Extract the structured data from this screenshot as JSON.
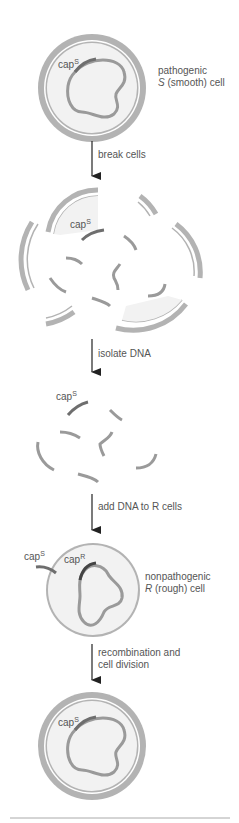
{
  "diagram": {
    "title": "",
    "colors": {
      "cell_wall": "#b3b3b3",
      "cytoplasm": "#f2f2f2",
      "dna": "#9a9a9a",
      "cap_gene": "#6e6e6e",
      "arrow": "#222222",
      "text": "#555555"
    },
    "stages": {
      "s_cell": {
        "label_line1": "pathogenic",
        "label_line2_italic": "S",
        "label_line2_rest": " (smooth) cell",
        "gene": "cap",
        "gene_sup": "S"
      },
      "broken_cells": {
        "gene": "cap",
        "gene_sup": "S"
      },
      "isolated_dna": {
        "gene": "cap",
        "gene_sup": "S"
      },
      "r_cell": {
        "label_line1": "nonpathogenic",
        "label_line2_italic": "R",
        "label_line2_rest": " (rough) cell",
        "gene_outside": "cap",
        "gene_outside_sup": "S",
        "gene_inside": "cap",
        "gene_inside_sup": "R"
      },
      "transformed_cell": {
        "gene": "cap",
        "gene_sup": "S"
      }
    },
    "arrows": [
      {
        "label": "break cells"
      },
      {
        "label": "isolate DNA"
      },
      {
        "label": "add DNA to R cells"
      },
      {
        "label_line1": "recombination and",
        "label_line2": "cell division"
      }
    ]
  }
}
